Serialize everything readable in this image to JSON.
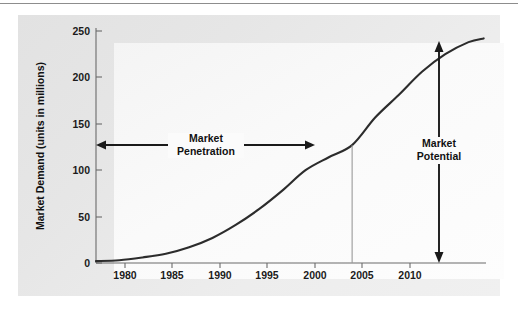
{
  "chart_data": {
    "type": "line",
    "title": "",
    "xlabel": "",
    "ylabel": "Market Demand (units in millions)",
    "xlim": [
      1978,
      2011.5
    ],
    "ylim": [
      0,
      250
    ],
    "grid": false,
    "legend": "none",
    "x_ticks": [
      "1980",
      "1985",
      "1990",
      "1995",
      "2000",
      "2005",
      "2010"
    ],
    "x_tick_values": [
      1980,
      1985,
      1990,
      1995,
      2000,
      2005,
      2010
    ],
    "y_ticks": [
      "0",
      "50",
      "100",
      "150",
      "200",
      "250"
    ],
    "y_tick_values": [
      0,
      50,
      100,
      150,
      200,
      250
    ],
    "series": [
      {
        "name": "Market demand S-curve",
        "x": [
          1978,
          1980,
          1982,
          1984,
          1986,
          1988,
          1990,
          1992,
          1994,
          1996,
          1998,
          2000,
          2002,
          2004,
          2006,
          2008,
          2010,
          2011.3
        ],
        "values": [
          2,
          3,
          6,
          10,
          17,
          27,
          41,
          58,
          78,
          100,
          114,
          127,
          157,
          181,
          206,
          225,
          238,
          242
        ]
      }
    ],
    "annotations": [
      {
        "name": "market-penetration",
        "label_line1": "Market",
        "label_line2": "Penetration",
        "type": "double-headed-horizontal-arrow",
        "from_x": 1978,
        "to_x": 2000,
        "at_y": 127,
        "description": "Horizontal double arrow from the y-axis to the curve at year 2000 (demand 127)"
      },
      {
        "name": "market-potential",
        "label_line1": "Market",
        "label_line2": "Potential",
        "type": "double-headed-vertical-arrow",
        "at_x": 2010.6,
        "from_y": 0,
        "to_y": 242,
        "description": "Vertical double arrow from the x-axis up to the curve plateau (~242)"
      }
    ],
    "drop_line": {
      "name": "year-2000-drop-line",
      "at_x": 2000,
      "from_y": 0,
      "to_y": 127
    },
    "colors": {
      "curve": "#2c2c2c",
      "axis": "#6b6b6b",
      "annotation": "#1a1a1a",
      "panel": "#e8e8e8",
      "plot_field": "#fafafa",
      "drop_line": "#9a9a9a"
    }
  }
}
